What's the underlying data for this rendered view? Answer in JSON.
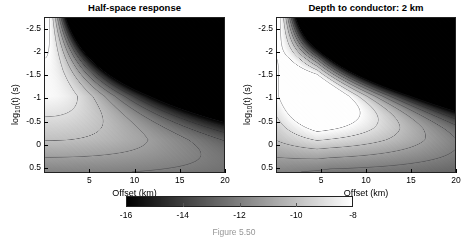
{
  "figure": {
    "background_color": "#ffffff",
    "caption_partial": "Figure 5.50"
  },
  "colorbar": {
    "name": "shared-grayscale-colorbar",
    "colormap": "grayscale",
    "min": -16,
    "max": -8,
    "ticks": [
      -16,
      -14,
      -12,
      -10,
      -8
    ],
    "tick_labels": [
      "-16",
      "-14",
      "-12",
      "-10",
      "-8"
    ],
    "orientation": "horizontal",
    "low_color": "#000000",
    "high_color": "#ffffff"
  },
  "axes_common": {
    "xlabel": "Offset (km)",
    "ylabel_prefix": "log",
    "ylabel_sub": "10",
    "ylabel_suffix": "(t) (s)",
    "xticks": [
      5,
      10,
      15,
      20
    ],
    "xtick_labels": [
      "5",
      "10",
      "15",
      "20"
    ],
    "xlim": [
      0,
      20
    ],
    "yticks": [
      -2.5,
      -2,
      -1.5,
      -1,
      -0.5,
      0,
      0.5
    ],
    "ytick_labels": [
      "-2.5",
      "-2",
      "-1.5",
      "-1",
      "-0.5",
      "0",
      "0.5"
    ],
    "ylim_top": -2.75,
    "ylim_bottom": 0.6,
    "y_axis_inverted": true
  },
  "panels": [
    {
      "id": "left",
      "title": "Half-space response",
      "model": "halfspace"
    },
    {
      "id": "right",
      "title": "Depth to conductor: 2 km",
      "model": "layered",
      "conductor_depth_km": 2
    }
  ],
  "chart_data": {
    "type": "heatmap",
    "xlabel": "Offset (km)",
    "ylabel": "log10(t) (s)",
    "zlabel": "log10 amplitude",
    "xlim": [
      0,
      20
    ],
    "ylim": [
      -2.75,
      0.6
    ],
    "zlim": [
      -16,
      -8
    ],
    "grid": false,
    "legend": "none",
    "colorbar_ticks": [
      -16,
      -14,
      -12,
      -10,
      -8
    ],
    "contour_levels": [
      -16,
      -15,
      -14,
      -13,
      -12,
      -11,
      -10,
      -9,
      -8
    ],
    "panels": [
      {
        "name": "Half-space response",
        "description": "Amplitude decays with offset and at early times; bright lobe at small offsets and intermediate times, dark region at large offset and early time.",
        "x": [
          0,
          2.5,
          5,
          7.5,
          10,
          12.5,
          15,
          17.5,
          20
        ],
        "y": [
          -2.5,
          -2,
          -1.5,
          -1,
          -0.5,
          0,
          0.5
        ],
        "z": [
          [
            -8.2,
            -9.6,
            -11.4,
            -13.2,
            -14.8,
            -15.6,
            -16.0,
            -16.0,
            -16.0
          ],
          [
            -8.3,
            -9.2,
            -10.7,
            -12.3,
            -13.8,
            -15.0,
            -15.8,
            -16.0,
            -16.0
          ],
          [
            -8.6,
            -9.1,
            -10.0,
            -11.2,
            -12.5,
            -13.6,
            -14.6,
            -15.4,
            -15.9
          ],
          [
            -9.1,
            -9.4,
            -9.9,
            -10.6,
            -11.4,
            -12.3,
            -13.1,
            -13.9,
            -14.6
          ],
          [
            -9.8,
            -10.0,
            -10.3,
            -10.7,
            -11.2,
            -11.7,
            -12.3,
            -12.8,
            -13.3
          ],
          [
            -10.5,
            -10.6,
            -10.8,
            -11.0,
            -11.3,
            -11.6,
            -11.9,
            -12.2,
            -12.5
          ],
          [
            -11.1,
            -11.2,
            -11.3,
            -11.4,
            -11.6,
            -11.8,
            -12.0,
            -12.2,
            -12.3
          ]
        ]
      },
      {
        "name": "Depth to conductor: 2 km",
        "description": "Conductive layer at 2 km creates a bright high-amplitude channel that spreads to large offsets at intermediate times, with a steep dark gradient above it at early times.",
        "x": [
          0,
          2.5,
          5,
          7.5,
          10,
          12.5,
          15,
          17.5,
          20
        ],
        "y": [
          -2.5,
          -2,
          -1.5,
          -1,
          -0.5,
          0,
          0.5
        ],
        "z": [
          [
            -8.2,
            -9.8,
            -12.0,
            -14.2,
            -15.4,
            -15.9,
            -16.0,
            -16.0,
            -16.0
          ],
          [
            -8.3,
            -9.4,
            -11.2,
            -13.0,
            -14.2,
            -15.0,
            -15.5,
            -15.8,
            -16.0
          ],
          [
            -8.6,
            -9.2,
            -10.2,
            -10.8,
            -11.1,
            -11.3,
            -11.5,
            -11.7,
            -11.9
          ],
          [
            -9.1,
            -9.5,
            -10.1,
            -10.5,
            -10.7,
            -10.9,
            -11.0,
            -11.2,
            -11.4
          ],
          [
            -9.8,
            -10.1,
            -10.5,
            -10.8,
            -11.0,
            -11.2,
            -11.4,
            -11.6,
            -11.8
          ],
          [
            -10.5,
            -10.7,
            -10.9,
            -11.1,
            -11.3,
            -11.5,
            -11.7,
            -11.9,
            -12.1
          ],
          [
            -11.1,
            -11.2,
            -11.4,
            -11.5,
            -11.7,
            -11.9,
            -12.1,
            -12.3,
            -12.5
          ]
        ]
      }
    ]
  }
}
